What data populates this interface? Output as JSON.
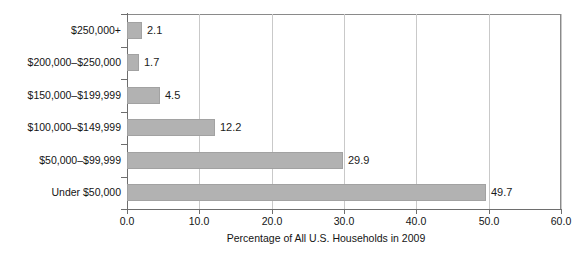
{
  "chart_data": {
    "type": "bar",
    "orientation": "horizontal",
    "title": "",
    "xlabel": "Percentage of All U.S. Households in 2009",
    "ylabel": "",
    "xlim": [
      0.0,
      60.0
    ],
    "xticks": [
      "0.0",
      "10.0",
      "20.0",
      "30.0",
      "40.0",
      "50.0",
      "60.0"
    ],
    "xtick_values": [
      0,
      10,
      20,
      30,
      40,
      50,
      60
    ],
    "grid": "vertical",
    "legend": "none",
    "bar_color": "#b2b2b2",
    "categories": [
      "$250,000+",
      "$200,000–$250,000",
      "$150,000–$199,999",
      "$100,000–$149,999",
      "$50,000–$99,999",
      "Under $50,000"
    ],
    "values": [
      2.1,
      1.7,
      4.5,
      12.2,
      29.9,
      49.7
    ],
    "value_labels": [
      "2.1",
      "1.7",
      "4.5",
      "12.2",
      "29.9",
      "49.7"
    ]
  }
}
